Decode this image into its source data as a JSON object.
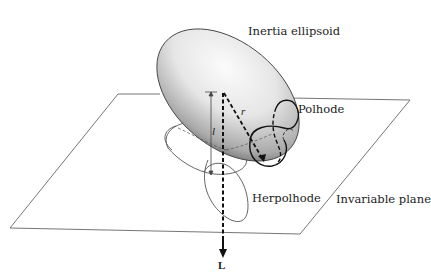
{
  "labels": {
    "inertia_ellipsoid": "Inertia ellipsoid",
    "polhode": "Polhode",
    "herpolhode": "Herpolhode",
    "invariable_plane": "Invariable plane",
    "angular_momentum": "L",
    "radius_vector": "r",
    "distance": "l"
  },
  "colors": {
    "line": "#555555",
    "dark": "#111111",
    "ellipsoid_light": "#fafafa",
    "ellipsoid_mid": "#d4d4d4",
    "ellipsoid_dark": "#6e6e6e",
    "text": "#222222"
  }
}
